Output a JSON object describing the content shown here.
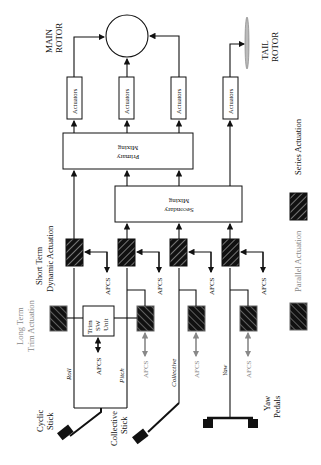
{
  "diagram": {
    "main_rotor": {
      "line1": "MAIN",
      "line2": "ROTOR"
    },
    "tail_rotor": {
      "line1": "TAIL",
      "line2": "ROTOR"
    },
    "actuators": [
      "Actuators",
      "Actuators",
      "Actuators",
      "Actuators"
    ],
    "primary_mixing": {
      "line1": "Primary",
      "line2": "Mixing"
    },
    "secondary_mixing": {
      "line1": "Secondary",
      "line2": "Mixing"
    },
    "short_term": {
      "line1": "Short Term",
      "line2": "Dynamic Actuation"
    },
    "long_term": {
      "line1": "Long Term",
      "line2": "Trim Actuation"
    },
    "trim_unit": {
      "line1": "Trim",
      "line2": "SW",
      "line3": "Unit"
    },
    "afcs": "AFCS",
    "channels": {
      "roll": "Roll",
      "pitch": "Pitch",
      "collective": "Collective",
      "yaw": "Yaw"
    },
    "inputs": {
      "cyclic": {
        "line1": "Cyclic",
        "line2": "Stick"
      },
      "collective": {
        "line1": "Collective",
        "line2": "Stick"
      },
      "yaw": {
        "line1": "Yaw",
        "line2": "Pedals"
      }
    },
    "legend": {
      "series": "Series Actuation",
      "parallel": "Parallel Actuation"
    }
  }
}
